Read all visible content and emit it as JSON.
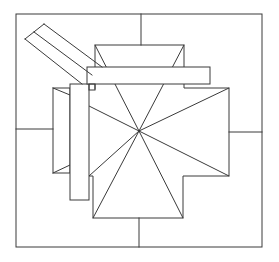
{
  "diagram": {
    "title": "",
    "colors": {
      "background": "#ffffff",
      "stroke": "#3a3a3a"
    },
    "stroke_width": 1,
    "outer_frame": {
      "x1": 16,
      "y1": 14,
      "x2": 262,
      "y2": 247
    },
    "frame_ticks": [
      {
        "name": "top",
        "x1": 141,
        "y1": 14,
        "x2": 141,
        "y2": 45
      },
      {
        "name": "left",
        "x1": 16,
        "y1": 129,
        "x2": 53,
        "y2": 129
      },
      {
        "name": "right",
        "x1": 229,
        "y1": 132,
        "x2": 262,
        "y2": 132
      },
      {
        "name": "bottom",
        "x1": 139,
        "y1": 218,
        "x2": 139,
        "y2": 247
      }
    ],
    "apex": {
      "x": 139,
      "y": 131
    },
    "roof_outline": [
      [
        95,
        67
      ],
      [
        95,
        45
      ],
      [
        184,
        45
      ],
      [
        184,
        67
      ]
    ],
    "roof_outline_right": [
      [
        184,
        84
      ],
      [
        184,
        88
      ],
      [
        229,
        88
      ],
      [
        229,
        176
      ],
      [
        183,
        176
      ],
      [
        183,
        218
      ],
      [
        93,
        218
      ],
      [
        93,
        176
      ],
      [
        89,
        176
      ]
    ],
    "roof_outline_left_stub": [
      [
        95,
        84
      ],
      [
        95,
        89
      ]
    ],
    "hip_ridges": [
      [
        95,
        45
      ],
      [
        184,
        45
      ],
      [
        229,
        88
      ],
      [
        229,
        176
      ],
      [
        183,
        218
      ],
      [
        93,
        218
      ],
      [
        89,
        176
      ],
      [
        89,
        106
      ]
    ],
    "left_panel": {
      "rect": {
        "x": 53,
        "y": 88,
        "w": 17,
        "h": 85
      },
      "diagonals": [
        {
          "x1": 53,
          "y1": 88,
          "x2": 70,
          "y2": 95
        },
        {
          "x1": 53,
          "y1": 173,
          "x2": 70,
          "y2": 165
        }
      ]
    },
    "vertical_beam": {
      "x": 70,
      "y": 84,
      "w": 19,
      "h": 116
    },
    "horizontal_beam": {
      "x": 87,
      "y": 67,
      "w": 123,
      "h": 17
    },
    "small_square": {
      "x": 89,
      "y": 84,
      "w": 6,
      "h": 6
    },
    "chimney_strip": {
      "edges": [
        {
          "x1": 25,
          "y1": 39,
          "x2": 82,
          "y2": 84
        },
        {
          "x1": 34,
          "y1": 32,
          "x2": 92,
          "y2": 75
        },
        {
          "x1": 44,
          "y1": 24,
          "x2": 102,
          "y2": 67
        }
      ],
      "cap": {
        "x1": 25,
        "y1": 39,
        "x2": 44,
        "y2": 24
      }
    }
  }
}
